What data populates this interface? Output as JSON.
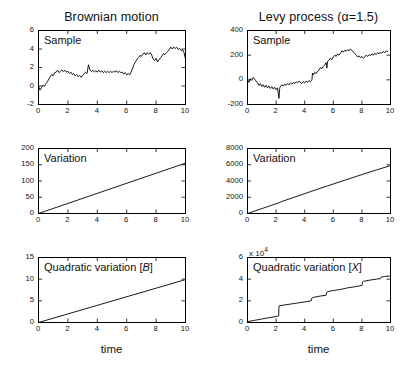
{
  "figure": {
    "background_color": "#ffffff",
    "line_color": "#000000",
    "width": 409,
    "height": 367
  },
  "columns": [
    {
      "title": "Brownian motion"
    },
    {
      "title": "Levy process (α=1.5)"
    }
  ],
  "axis_labels": {
    "x_left": "time",
    "x_right": "time"
  },
  "panels": {
    "bm_sample": {
      "inner_label": "Sample",
      "xticks": [
        "0",
        "2",
        "4",
        "6",
        "8",
        "10"
      ],
      "yticks": [
        "-2",
        "0",
        "2",
        "4",
        "6"
      ],
      "multiplier": ""
    },
    "bm_variation": {
      "inner_label": "Variation",
      "xticks": [
        "0",
        "2",
        "4",
        "6",
        "8",
        "10"
      ],
      "yticks": [
        "0",
        "50",
        "100",
        "150",
        "200"
      ],
      "multiplier": ""
    },
    "bm_quadratic": {
      "inner_label_prefix": "Quadratic variation [",
      "inner_label_symbol": "B",
      "inner_label_suffix": "]",
      "xticks": [
        "0",
        "2",
        "4",
        "6",
        "8",
        "10"
      ],
      "yticks": [
        "0",
        "5",
        "10",
        "15"
      ],
      "multiplier": ""
    },
    "levy_sample": {
      "inner_label": "Sample",
      "xticks": [
        "0",
        "2",
        "4",
        "6",
        "8",
        "10"
      ],
      "yticks": [
        "-200",
        "0",
        "200",
        "400"
      ],
      "multiplier": ""
    },
    "levy_variation": {
      "inner_label": "Variation",
      "xticks": [
        "0",
        "2",
        "4",
        "6",
        "8",
        "10"
      ],
      "yticks": [
        "0",
        "2000",
        "4000",
        "6000",
        "8000"
      ],
      "multiplier": ""
    },
    "levy_quadratic": {
      "inner_label_prefix": "Quadratic variation [",
      "inner_label_symbol": "X",
      "inner_label_suffix": "]",
      "xticks": [
        "0",
        "2",
        "4",
        "6",
        "8",
        "10"
      ],
      "yticks": [
        "0",
        "2",
        "4",
        "6"
      ],
      "multiplier": "x 10",
      "multiplier_exp": "4"
    }
  },
  "chart_data": [
    {
      "id": "bm_sample",
      "type": "line",
      "title": "Brownian motion",
      "annotation": "Sample",
      "xlabel": "",
      "ylabel": "",
      "xlim": [
        0,
        10
      ],
      "ylim": [
        -2,
        6
      ],
      "xticks": [
        0,
        2,
        4,
        6,
        8,
        10
      ],
      "yticks": [
        -2,
        0,
        2,
        4,
        6
      ],
      "grid": false,
      "legend": "none",
      "x": [
        0,
        0.1,
        0.2,
        0.3,
        0.4,
        0.5,
        0.6,
        0.7,
        0.8,
        0.9,
        1.0,
        1.1,
        1.2,
        1.3,
        1.4,
        1.5,
        1.6,
        1.7,
        1.8,
        1.9,
        2.0,
        2.1,
        2.2,
        2.3,
        2.4,
        2.5,
        2.6,
        2.7,
        2.8,
        2.9,
        3.0,
        3.1,
        3.2,
        3.3,
        3.4,
        3.5,
        3.6,
        3.7,
        3.8,
        3.9,
        4.0,
        4.1,
        4.2,
        4.3,
        4.4,
        4.5,
        4.6,
        4.7,
        4.8,
        4.9,
        5.0,
        5.1,
        5.2,
        5.3,
        5.4,
        5.5,
        5.6,
        5.7,
        5.8,
        5.9,
        6.0,
        6.1,
        6.2,
        6.3,
        6.4,
        6.5,
        6.6,
        6.7,
        6.8,
        6.9,
        7.0,
        7.1,
        7.2,
        7.3,
        7.4,
        7.5,
        7.6,
        7.7,
        7.8,
        7.9,
        8.0,
        8.1,
        8.2,
        8.3,
        8.4,
        8.5,
        8.6,
        8.7,
        8.8,
        8.9,
        9.0,
        9.1,
        9.2,
        9.3,
        9.4,
        9.5,
        9.6,
        9.7,
        9.8,
        9.9,
        10.0
      ],
      "y": [
        0.0,
        -0.45,
        -0.2,
        0.1,
        -0.05,
        0.25,
        0.45,
        0.75,
        1.0,
        1.25,
        1.1,
        1.45,
        1.5,
        1.7,
        1.45,
        1.6,
        1.75,
        1.55,
        1.7,
        1.5,
        1.6,
        1.35,
        1.5,
        1.25,
        1.35,
        1.1,
        1.25,
        1.0,
        1.15,
        0.95,
        1.15,
        1.3,
        1.5,
        1.35,
        2.3,
        1.75,
        1.55,
        1.7,
        1.5,
        1.65,
        1.5,
        1.7,
        1.5,
        1.65,
        1.45,
        1.6,
        1.45,
        1.6,
        1.45,
        1.6,
        1.45,
        1.6,
        1.5,
        1.65,
        1.45,
        1.6,
        1.45,
        1.5,
        1.3,
        1.45,
        1.2,
        1.35,
        1.2,
        1.5,
        1.9,
        2.35,
        2.6,
        2.9,
        3.05,
        3.3,
        3.2,
        3.45,
        3.6,
        3.35,
        3.6,
        3.45,
        3.6,
        3.35,
        2.9,
        2.75,
        3.0,
        2.6,
        2.85,
        3.05,
        3.25,
        3.5,
        3.4,
        3.6,
        3.75,
        3.95,
        4.2,
        4.0,
        4.2,
        4.05,
        4.2,
        3.95,
        4.05,
        3.85,
        3.9,
        3.6,
        2.9
      ]
    },
    {
      "id": "bm_variation",
      "type": "line",
      "title": "",
      "annotation": "Variation",
      "xlabel": "",
      "ylabel": "",
      "xlim": [
        0,
        10
      ],
      "ylim": [
        0,
        200
      ],
      "xticks": [
        0,
        2,
        4,
        6,
        8,
        10
      ],
      "yticks": [
        0,
        50,
        100,
        150,
        200
      ],
      "grid": false,
      "legend": "none",
      "x": [
        0,
        10
      ],
      "y": [
        0,
        155
      ]
    },
    {
      "id": "bm_quadratic",
      "type": "line",
      "title": "",
      "annotation": "Quadratic variation [B]",
      "xlabel": "time",
      "ylabel": "",
      "xlim": [
        0,
        10
      ],
      "ylim": [
        0,
        15
      ],
      "xticks": [
        0,
        2,
        4,
        6,
        8,
        10
      ],
      "yticks": [
        0,
        5,
        10,
        15
      ],
      "grid": false,
      "legend": "none",
      "x": [
        0,
        10
      ],
      "y": [
        0,
        9.9
      ]
    },
    {
      "id": "levy_sample",
      "type": "line",
      "title": "Levy process (α=1.5)",
      "annotation": "Sample",
      "xlabel": "",
      "ylabel": "",
      "xlim": [
        0,
        10
      ],
      "ylim": [
        -200,
        400
      ],
      "xticks": [
        0,
        2,
        4,
        6,
        8,
        10
      ],
      "yticks": [
        -200,
        0,
        200,
        400
      ],
      "grid": false,
      "legend": "none",
      "x": [
        0,
        0.1,
        0.2,
        0.3,
        0.4,
        0.5,
        0.6,
        0.7,
        0.8,
        0.9,
        1.0,
        1.1,
        1.2,
        1.3,
        1.4,
        1.5,
        1.6,
        1.7,
        1.8,
        1.9,
        2.0,
        2.1,
        2.2,
        2.25,
        2.3,
        2.4,
        2.5,
        2.6,
        2.7,
        2.8,
        2.9,
        3.0,
        3.1,
        3.2,
        3.3,
        3.4,
        3.5,
        3.6,
        3.7,
        3.8,
        3.9,
        4.0,
        4.1,
        4.2,
        4.3,
        4.4,
        4.5,
        4.55,
        4.6,
        4.7,
        4.8,
        4.9,
        5.0,
        5.1,
        5.2,
        5.3,
        5.4,
        5.5,
        5.55,
        5.6,
        5.7,
        5.8,
        5.9,
        6.0,
        6.1,
        6.2,
        6.3,
        6.4,
        6.5,
        6.6,
        6.7,
        6.8,
        6.9,
        7.0,
        7.1,
        7.2,
        7.3,
        7.4,
        7.5,
        7.6,
        7.7,
        7.8,
        7.9,
        8.0,
        8.1,
        8.2,
        8.3,
        8.4,
        8.5,
        8.6,
        8.7,
        8.8,
        8.9,
        9.0,
        9.1,
        9.2,
        9.3,
        9.4,
        9.5,
        9.6,
        9.7,
        9.8,
        9.9,
        10.0
      ],
      "y": [
        0,
        -20,
        10,
        -5,
        20,
        5,
        -10,
        -25,
        -45,
        -30,
        -55,
        -40,
        -60,
        -45,
        -65,
        -50,
        -70,
        -55,
        -75,
        -60,
        -80,
        -65,
        -150,
        -70,
        -55,
        -40,
        -50,
        -35,
        -45,
        -30,
        -40,
        -25,
        -35,
        -20,
        -30,
        -15,
        -25,
        -10,
        -20,
        -30,
        -15,
        -25,
        -10,
        -20,
        -5,
        -15,
        -5,
        55,
        40,
        60,
        50,
        70,
        80,
        100,
        90,
        110,
        120,
        140,
        95,
        150,
        160,
        175,
        165,
        185,
        200,
        190,
        210,
        200,
        215,
        235,
        225,
        240,
        230,
        245,
        235,
        250,
        240,
        225,
        215,
        200,
        185,
        195,
        180,
        190,
        175,
        185,
        200,
        190,
        205,
        195,
        210,
        200,
        215,
        205,
        220,
        210,
        225,
        215,
        230,
        220,
        235,
        230
      ]
    },
    {
      "id": "levy_variation",
      "type": "line",
      "title": "",
      "annotation": "Variation",
      "xlabel": "",
      "ylabel": "",
      "xlim": [
        0,
        10
      ],
      "ylim": [
        0,
        8000
      ],
      "xticks": [
        0,
        2,
        4,
        6,
        8,
        10
      ],
      "yticks": [
        0,
        2000,
        4000,
        6000,
        8000
      ],
      "grid": false,
      "legend": "none",
      "x": [
        0,
        2.2,
        2.35,
        4.5,
        5.6,
        8.1,
        10
      ],
      "y": [
        0,
        1320,
        1450,
        2750,
        3400,
        4850,
        5900
      ]
    },
    {
      "id": "levy_quadratic",
      "type": "line",
      "title": "",
      "annotation": "Quadratic variation [X]",
      "xlabel": "time",
      "ylabel": "",
      "xlim": [
        0,
        10
      ],
      "ylim": [
        0,
        6
      ],
      "y_multiplier": 10000,
      "y_multiplier_label": "x 10^4",
      "xticks": [
        0,
        2,
        4,
        6,
        8,
        10
      ],
      "yticks": [
        0,
        2,
        4,
        6
      ],
      "grid": false,
      "legend": "none",
      "x": [
        0,
        0.5,
        1.0,
        1.5,
        2.0,
        2.18,
        2.2,
        2.22,
        2.6,
        3.0,
        3.5,
        4.0,
        4.45,
        4.5,
        4.55,
        5.0,
        5.5,
        5.55,
        5.6,
        6.0,
        6.5,
        7.0,
        7.5,
        8.0,
        8.05,
        8.1,
        8.5,
        9.0,
        9.3,
        9.35,
        9.6,
        10.0
      ],
      "y": [
        0.08,
        0.2,
        0.32,
        0.44,
        0.55,
        0.6,
        1.5,
        1.55,
        1.62,
        1.7,
        1.8,
        1.9,
        2.0,
        2.25,
        2.3,
        2.42,
        2.52,
        2.8,
        2.85,
        2.95,
        3.05,
        3.2,
        3.3,
        3.42,
        3.75,
        3.8,
        3.9,
        4.0,
        4.05,
        4.2,
        4.25,
        4.3
      ]
    }
  ]
}
